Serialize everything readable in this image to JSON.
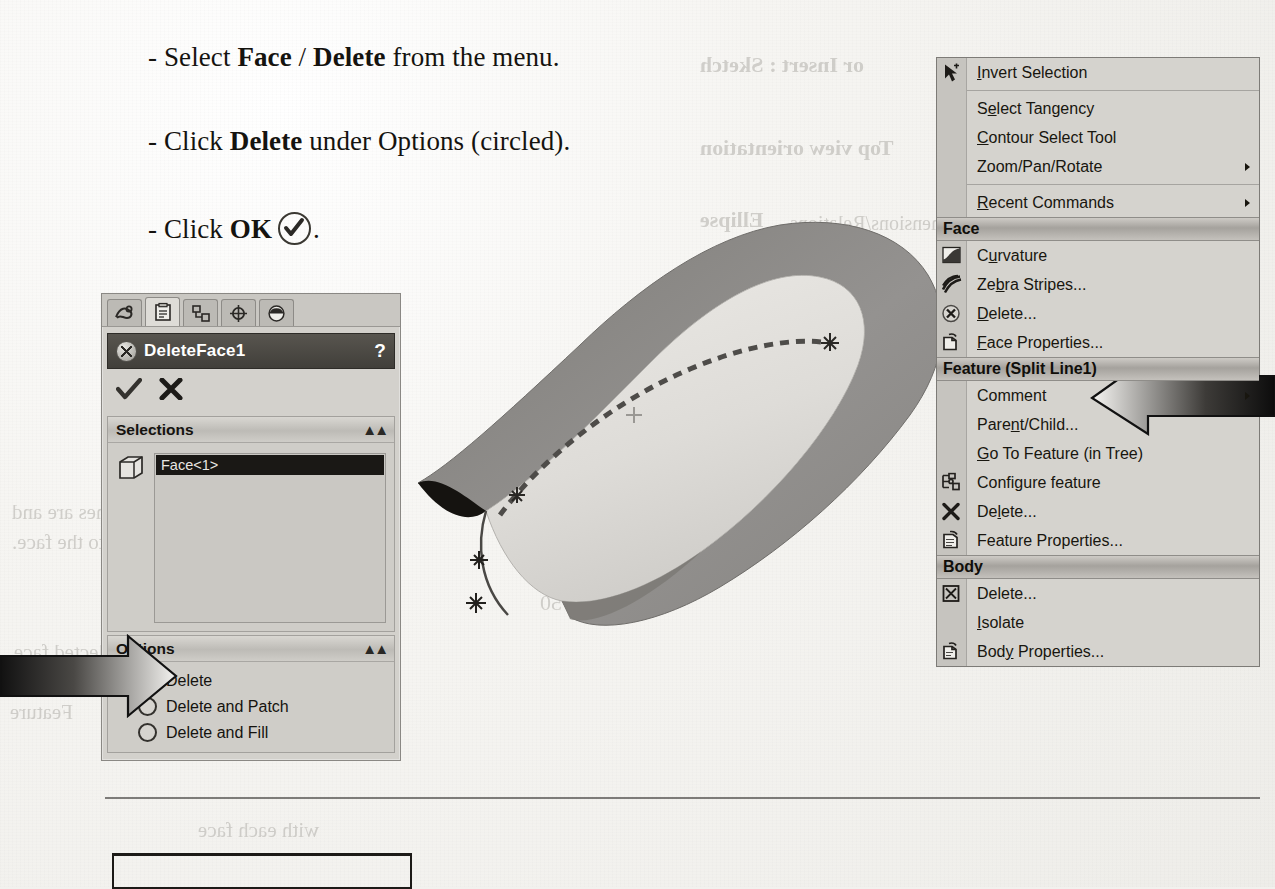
{
  "instructions": [
    {
      "id": "line1",
      "prefix": "- Select ",
      "bold1": "Face",
      "mid": " / ",
      "bold2": "Delete",
      "suffix": " from the menu."
    },
    {
      "id": "line2",
      "prefix": "- Click ",
      "bold1": "Delete",
      "mid": " under Options (circled).",
      "bold2": "",
      "suffix": ""
    },
    {
      "id": "line3",
      "prefix": "- Click ",
      "bold1": "OK",
      "mid": "",
      "bold2": "",
      "suffix": "."
    }
  ],
  "property_manager": {
    "tabs": [
      {
        "name": "feature-manager-tab",
        "icon": "feature-tree-icon",
        "active": false
      },
      {
        "name": "property-manager-tab",
        "icon": "clipboard-icon",
        "active": true
      },
      {
        "name": "configuration-manager-tab",
        "icon": "configuration-icon",
        "active": false
      },
      {
        "name": "dimxpert-manager-tab",
        "icon": "target-icon",
        "active": false
      },
      {
        "name": "display-manager-tab",
        "icon": "appearance-sphere-icon",
        "active": false
      }
    ],
    "title": "DeleteFace1",
    "title_icon": "delete-face-icon",
    "help_label": "?",
    "accept_label": "OK",
    "cancel_label": "Cancel",
    "sections": [
      {
        "header": "Selections",
        "collapse_label": "«",
        "items": [
          "Face<1>"
        ]
      },
      {
        "header": "Options",
        "collapse_label": "«",
        "radios": [
          {
            "label": "Delete",
            "selected": true
          },
          {
            "label": "Delete and Patch",
            "selected": false
          },
          {
            "label": "Delete and Fill",
            "selected": false
          }
        ]
      }
    ]
  },
  "context_menu": {
    "entries": [
      {
        "type": "item",
        "label": "Invert Selection",
        "mnemonic": "I",
        "icon": "cursor-arrow-icon",
        "submenu": false
      },
      {
        "type": "separator"
      },
      {
        "type": "item",
        "label": "Select Tangency",
        "mnemonic": "e",
        "icon": "",
        "submenu": false
      },
      {
        "type": "item",
        "label": "Contour Select Tool",
        "mnemonic": "C",
        "icon": "",
        "submenu": false
      },
      {
        "type": "item",
        "label": "Zoom/Pan/Rotate",
        "mnemonic": "",
        "icon": "",
        "submenu": true
      },
      {
        "type": "separator"
      },
      {
        "type": "item",
        "label": "Recent Commands",
        "mnemonic": "R",
        "icon": "",
        "submenu": true
      },
      {
        "type": "group",
        "label": "Face"
      },
      {
        "type": "item",
        "label": "Curvature",
        "mnemonic": "u",
        "icon": "curvature-icon",
        "submenu": false
      },
      {
        "type": "item",
        "label": "Zebra Stripes...",
        "mnemonic": "b",
        "icon": "zebra-stripes-icon",
        "submenu": false
      },
      {
        "type": "item",
        "label": "Delete...",
        "mnemonic": "D",
        "icon": "delete-face-icon",
        "submenu": false,
        "highlight": true
      },
      {
        "type": "item",
        "label": "Face Properties...",
        "mnemonic": "F",
        "icon": "face-properties-icon",
        "submenu": false
      },
      {
        "type": "group",
        "label": "Feature (Split Line1)"
      },
      {
        "type": "item",
        "label": "Comment",
        "mnemonic": "",
        "icon": "",
        "submenu": true
      },
      {
        "type": "item",
        "label": "Parent/Child...",
        "mnemonic": "n",
        "icon": "",
        "submenu": false
      },
      {
        "type": "item",
        "label": "Go To Feature (in Tree)",
        "mnemonic": "G",
        "icon": "",
        "submenu": false
      },
      {
        "type": "item",
        "label": "Configure feature",
        "mnemonic": "g",
        "icon": "configure-feature-icon",
        "submenu": false
      },
      {
        "type": "item",
        "label": "Delete...",
        "mnemonic": "l",
        "icon": "delete-x-icon",
        "submenu": false
      },
      {
        "type": "item",
        "label": "Feature Properties...",
        "mnemonic": "",
        "icon": "feature-properties-icon",
        "submenu": false
      },
      {
        "type": "group",
        "label": "Body"
      },
      {
        "type": "item",
        "label": "Delete...",
        "mnemonic": "",
        "icon": "delete-body-icon",
        "submenu": false
      },
      {
        "type": "item",
        "label": "Isolate",
        "mnemonic": "I",
        "icon": "",
        "submenu": false
      },
      {
        "type": "item",
        "label": "Body Properties...",
        "mnemonic": "y",
        "icon": "body-properties-icon",
        "submenu": false
      }
    ]
  },
  "viewport": {
    "model_name": "split-line-surface-model",
    "split_line_label": "dashed split line curve",
    "origin_marker": "origin-cross"
  },
  "bleed_through": [
    {
      "text": "or Insert : Sketch",
      "x": 700,
      "y": 52,
      "size": 22,
      "weight": "bold"
    },
    {
      "text": "Top view orientation",
      "x": 700,
      "y": 135,
      "size": 22,
      "weight": "bold"
    },
    {
      "text": "Ellipse",
      "x": 700,
      "y": 207,
      "size": 22,
      "weight": "bold"
    },
    {
      "text": "and Dimensions/Relations",
      "x": 790,
      "y": 212,
      "size": 20,
      "weight": "normal"
    },
    {
      "text": "The Split Lines are and",
      "x": 12,
      "y": 500,
      "size": 21,
      "weight": "normal"
    },
    {
      "text": "projected onto the face.",
      "x": 12,
      "y": 530,
      "size": 21,
      "weight": "normal"
    },
    {
      "text": "selected face",
      "x": 14,
      "y": 640,
      "size": 21,
      "weight": "normal"
    },
    {
      "text": "deleted",
      "x": 14,
      "y": 668,
      "size": 21,
      "weight": "normal"
    },
    {
      "text": "Feature",
      "x": 10,
      "y": 700,
      "size": 21,
      "weight": "normal"
    },
    {
      "text": "with each face",
      "x": 198,
      "y": 818,
      "size": 21,
      "weight": "normal"
    },
    {
      "text": "2.750",
      "x": 540,
      "y": 590,
      "size": 22,
      "weight": "normal"
    },
    {
      "text": "0.00",
      "x": 600,
      "y": 330,
      "size": 22,
      "weight": "normal"
    }
  ],
  "colors": {
    "panel_bg": "#d3d1cc",
    "panel_title_bg": "#46443f",
    "menu_bg": "#d5d3ce",
    "group_band": "#a5a29d",
    "selection_highlight": "#1a1815",
    "ink": "#15130f",
    "surface_dark": "#8c8a86",
    "surface_light": "#dcdad6"
  }
}
